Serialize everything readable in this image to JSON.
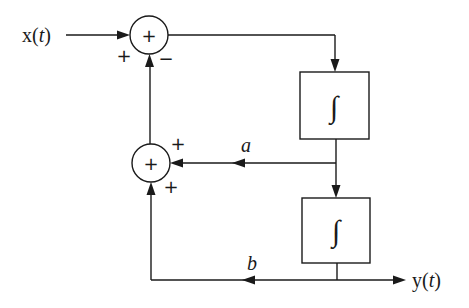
{
  "diagram": {
    "input": {
      "name": "x",
      "arg": "t"
    },
    "output": {
      "name": "y",
      "arg": "t"
    },
    "summer_top": {
      "symbol": "+",
      "input_signs": {
        "left": "+",
        "bottom": "−"
      }
    },
    "summer_bottom": {
      "symbol": "+",
      "input_signs": {
        "right": "+",
        "bottom": "+"
      }
    },
    "integrator_top": {
      "symbol": "∫"
    },
    "integrator_bottom": {
      "symbol": "∫"
    },
    "gains": {
      "a": "a",
      "b": "b"
    }
  }
}
